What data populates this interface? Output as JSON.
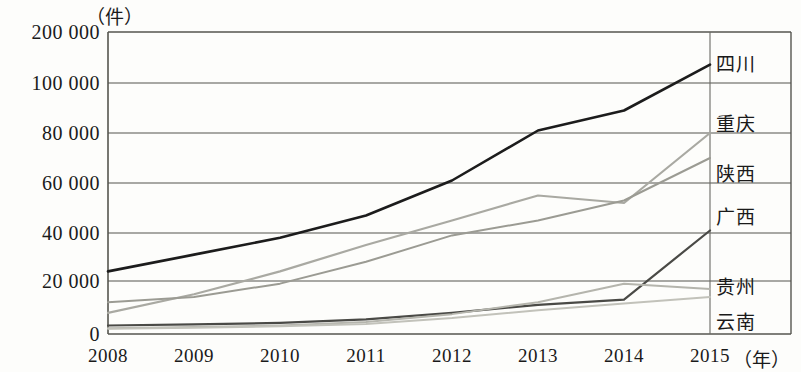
{
  "chart_data": {
    "type": "line",
    "title": "",
    "subtitle": "",
    "xlabel": "年",
    "ylabel": "件",
    "unit_top_left": "（件）",
    "unit_bottom_right": "（年）",
    "grid": true,
    "legend_position": "right-inline",
    "axis_note": "broken y-axis: 0–100000 linear, compressed band 100000–200000",
    "categories": [
      "2008",
      "2009",
      "2010",
      "2011",
      "2012",
      "2013",
      "2014",
      "2015"
    ],
    "x": [
      2008,
      2009,
      2010,
      2011,
      2012,
      2013,
      2014,
      2015
    ],
    "ytick_labels": [
      "200 000",
      "100 000",
      "80 000",
      "60 000",
      "40 000",
      "20 000",
      "0"
    ],
    "ytick_values": [
      200000,
      100000,
      80000,
      60000,
      40000,
      20000,
      0
    ],
    "ylim": [
      0,
      200000
    ],
    "series": [
      {
        "name": "四川",
        "color": "#1c1c1c",
        "width": 2.6,
        "values": [
          24000,
          31000,
          38000,
          47000,
          61000,
          81000,
          89000,
          136000
        ]
      },
      {
        "name": "重庆",
        "color": "#a9a9a2",
        "width": 2.2,
        "values": [
          8000,
          15000,
          24000,
          35000,
          45000,
          55000,
          52000,
          80000
        ]
      },
      {
        "name": "陕西",
        "color": "#9b9b93",
        "width": 2.0,
        "values": [
          12000,
          14000,
          19000,
          28000,
          39000,
          45000,
          53000,
          70000
        ]
      },
      {
        "name": "广西",
        "color": "#4a4a46",
        "width": 2.2,
        "values": [
          3200,
          3600,
          4200,
          5500,
          8000,
          11000,
          13000,
          41000
        ]
      },
      {
        "name": "贵州",
        "color": "#b5b5ad",
        "width": 2.0,
        "values": [
          2200,
          2600,
          3200,
          4500,
          7500,
          12000,
          19000,
          17000
        ]
      },
      {
        "name": "云南",
        "color": "#c2c2ba",
        "width": 2.0,
        "values": [
          2000,
          2400,
          2900,
          3800,
          6000,
          9000,
          11500,
          14000
        ]
      }
    ]
  },
  "labels": {
    "sichuan": "四川",
    "chongqing": "重庆",
    "shaanxi": "陕西",
    "guangxi": "广西",
    "guizhou": "贵州",
    "yunnan": "云南"
  }
}
